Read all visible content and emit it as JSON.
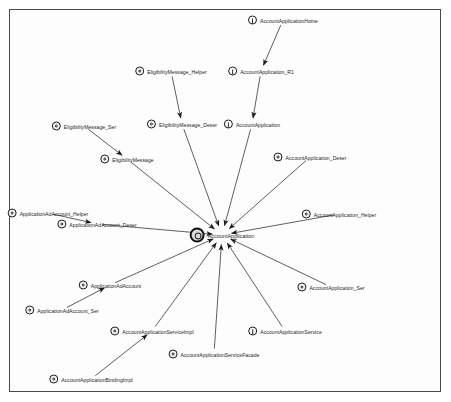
{
  "diagram": {
    "type": "dependency-graph",
    "background": "#ffffff",
    "border_color": "#4a4a4a",
    "edge_color": "#1b1b1b",
    "center_node": "AccountApplication",
    "nodes": [
      {
        "id": "n0",
        "label": "AccountApplication",
        "kind": "class",
        "x": 222,
        "y": 235,
        "label_side": "right",
        "center": true
      },
      {
        "id": "n1",
        "label": "AccountApplicationHome",
        "kind": "interface",
        "x": 283,
        "y": 20,
        "label_side": "right",
        "center": false
      },
      {
        "id": "n2",
        "label": "AccountApplication_R1",
        "kind": "interface",
        "x": 261,
        "y": 71,
        "label_side": "right",
        "center": false
      },
      {
        "id": "n3",
        "label": "EligibilityMessage_Helper",
        "kind": "class",
        "x": 171,
        "y": 71,
        "label_side": "right",
        "center": false
      },
      {
        "id": "n4",
        "label": "EligibilityMessage_Deser",
        "kind": "class",
        "x": 182,
        "y": 124,
        "label_side": "right",
        "center": false
      },
      {
        "id": "n5",
        "label": "AccountApplication",
        "kind": "interface",
        "x": 252,
        "y": 124,
        "label_side": "right",
        "center": false
      },
      {
        "id": "n6",
        "label": "EligibilityMessage_Ser",
        "kind": "class",
        "x": 84,
        "y": 126,
        "label_side": "right",
        "center": false
      },
      {
        "id": "n7",
        "label": "EligibilityMessage",
        "kind": "class",
        "x": 127,
        "y": 159,
        "label_side": "right",
        "center": false
      },
      {
        "id": "n8",
        "label": "AccountApplication_Deser",
        "kind": "class",
        "x": 310,
        "y": 157,
        "label_side": "right",
        "center": false
      },
      {
        "id": "n9",
        "label": "ApplicationAdAccount_Helper",
        "kind": "class",
        "x": 48,
        "y": 213,
        "label_side": "right",
        "center": false
      },
      {
        "id": "n10",
        "label": "ApplicationAdAccount_Deser",
        "kind": "class",
        "x": 97,
        "y": 224,
        "label_side": "right",
        "center": false
      },
      {
        "id": "n11",
        "label": "AccountApplication_Helper",
        "kind": "class",
        "x": 339,
        "y": 214,
        "label_side": "right",
        "center": false
      },
      {
        "id": "n12",
        "label": "AccountApplication_Ser",
        "kind": "class",
        "x": 331,
        "y": 287,
        "label_side": "right",
        "center": false
      },
      {
        "id": "n13",
        "label": "ApplicationAdAccount",
        "kind": "class",
        "x": 110,
        "y": 285,
        "label_side": "right",
        "center": false
      },
      {
        "id": "n14",
        "label": "ApplicationAdAccount_Ser",
        "kind": "class",
        "x": 62,
        "y": 310,
        "label_side": "right",
        "center": false
      },
      {
        "id": "n15",
        "label": "AccountApplicationServiceImpl",
        "kind": "class",
        "x": 152,
        "y": 331,
        "label_side": "right",
        "center": false
      },
      {
        "id": "n16",
        "label": "AccountApplicationService",
        "kind": "interface",
        "x": 285,
        "y": 331,
        "label_side": "right",
        "center": false
      },
      {
        "id": "n17",
        "label": "AccountApplicationServiceFacade",
        "kind": "class",
        "x": 214,
        "y": 354,
        "label_side": "right",
        "center": false
      },
      {
        "id": "n18",
        "label": "AccountApplicationBindingImpl",
        "kind": "class",
        "x": 91,
        "y": 379,
        "label_side": "right",
        "center": false
      }
    ],
    "edges": [
      {
        "from": "n1",
        "to": "n2",
        "arrow": true
      },
      {
        "from": "n2",
        "to": "n5",
        "arrow": true
      },
      {
        "from": "n3",
        "to": "n4",
        "arrow": true
      },
      {
        "from": "n4",
        "to": "n0",
        "arrow": true
      },
      {
        "from": "n5",
        "to": "n0",
        "arrow": true
      },
      {
        "from": "n6",
        "to": "n7",
        "arrow": true
      },
      {
        "from": "n7",
        "to": "n0",
        "arrow": true
      },
      {
        "from": "n8",
        "to": "n0",
        "arrow": true
      },
      {
        "from": "n9",
        "to": "n10",
        "arrow": true
      },
      {
        "from": "n10",
        "to": "n0",
        "arrow": true
      },
      {
        "from": "n11",
        "to": "n0",
        "arrow": true
      },
      {
        "from": "n12",
        "to": "n0",
        "arrow": true
      },
      {
        "from": "n14",
        "to": "n13",
        "arrow": true
      },
      {
        "from": "n13",
        "to": "n0",
        "arrow": true
      },
      {
        "from": "n15",
        "to": "n0",
        "arrow": true
      },
      {
        "from": "n16",
        "to": "n0",
        "arrow": true
      },
      {
        "from": "n17",
        "to": "n0",
        "arrow": true
      },
      {
        "from": "n18",
        "to": "n15",
        "arrow": true
      }
    ]
  }
}
